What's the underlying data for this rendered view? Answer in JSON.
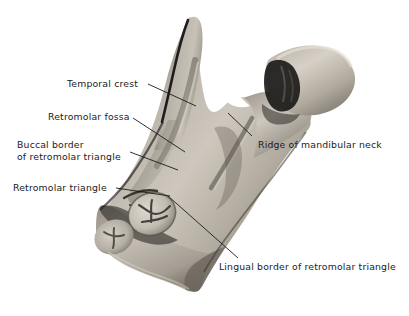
{
  "figure": {
    "background_color": "#ffffff",
    "ink_color": "#1b1b1b",
    "bone_tone_light": "#d8d4cd",
    "bone_tone_mid": "#a49e95",
    "bone_tone_dark": "#4a4641",
    "bone_tone_shadow": "#22201e",
    "tooth_tone": "#cfc9c0"
  },
  "labels": [
    {
      "id": "temporal-crest",
      "text": "Temporal crest"
    },
    {
      "id": "retromolar-fossa",
      "text": "Retromolar fossa"
    },
    {
      "id": "buccal-border-line1",
      "text": "Buccal border"
    },
    {
      "id": "buccal-border-line2",
      "text": "of retromolar triangle"
    },
    {
      "id": "retromolar-triangle",
      "text": "Retromolar triangle"
    },
    {
      "id": "ridge-mandibular-neck",
      "text": "Ridge of mandibular neck"
    },
    {
      "id": "lingual-border",
      "text": "Lingual border of retromolar triangle"
    }
  ],
  "structures": [
    {
      "id": "coronoid-process",
      "name": "Coronoid process"
    },
    {
      "id": "mandibular-notch",
      "name": "Mandibular (sigmoid) notch"
    },
    {
      "id": "condylar-head",
      "name": "Condylar head"
    },
    {
      "id": "mandibular-neck",
      "name": "Mandibular neck"
    },
    {
      "id": "ramus",
      "name": "Ramus of mandible"
    },
    {
      "id": "molar-teeth",
      "name": "Molar teeth"
    },
    {
      "id": "gonial-angle",
      "name": "Angle of mandible"
    }
  ]
}
